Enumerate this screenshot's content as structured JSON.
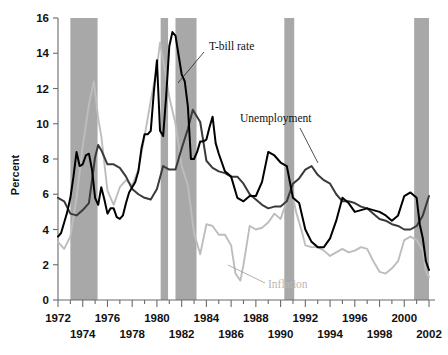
{
  "chart_data": {
    "type": "line",
    "title": "",
    "xlabel": "",
    "ylabel": "Percent",
    "xlim": [
      1972,
      2002
    ],
    "ylim": [
      0,
      16
    ],
    "ytick_step": 2,
    "grid": false,
    "legend_position": "inline-annotations",
    "ytick_labels": [
      "0",
      "2",
      "4",
      "6",
      "8",
      "10",
      "12",
      "14",
      "16"
    ],
    "xtick_labels_row1": [
      "1972",
      "1976",
      "1980",
      "1984",
      "1988",
      "1992",
      "1996",
      "2000"
    ],
    "xtick_labels_row2": [
      "1974",
      "1978",
      "1982",
      "1986",
      "1990",
      "1994",
      "1998",
      "2002"
    ],
    "xtick_years_row1": [
      1972,
      1976,
      1980,
      1984,
      1988,
      1992,
      1996,
      2000
    ],
    "xtick_years_row2": [
      1974,
      1978,
      1982,
      1986,
      1990,
      1994,
      1998,
      2002
    ],
    "annotations": [
      {
        "name": "t-bill-rate",
        "text": "T-bill rate",
        "color": "#111111"
      },
      {
        "name": "unemployment",
        "text": "Unemployment",
        "color": "#111111"
      },
      {
        "name": "inflation",
        "text": "Inflation",
        "color": "#b9b9b9"
      }
    ],
    "shaded_regions_label": "Recessions",
    "shaded_regions": [
      {
        "start": 1973.0,
        "end": 1975.2
      },
      {
        "start": 1980.3,
        "end": 1980.9
      },
      {
        "start": 1981.5,
        "end": 1983.2
      },
      {
        "start": 1990.3,
        "end": 1991.1
      },
      {
        "start": 2000.8,
        "end": 2002.6
      }
    ],
    "series": [
      {
        "name": "T-bill rate",
        "color": "#000000",
        "x": [
          1972.0,
          1972.25,
          1972.5,
          1972.75,
          1973.0,
          1973.25,
          1973.5,
          1973.75,
          1974.0,
          1974.25,
          1974.5,
          1974.75,
          1975.0,
          1975.25,
          1975.5,
          1975.75,
          1976.0,
          1976.25,
          1976.5,
          1976.75,
          1977.0,
          1977.25,
          1977.5,
          1977.75,
          1978.0,
          1978.25,
          1978.5,
          1978.75,
          1979.0,
          1979.25,
          1979.5,
          1979.75,
          1980.0,
          1980.25,
          1980.5,
          1980.75,
          1981.0,
          1981.25,
          1981.5,
          1981.75,
          1982.0,
          1982.25,
          1982.5,
          1982.75,
          1983.0,
          1983.25,
          1983.5,
          1983.75,
          1984.0,
          1984.25,
          1984.5,
          1984.75,
          1985.0,
          1985.5,
          1986.0,
          1986.5,
          1987.0,
          1987.5,
          1988.0,
          1988.5,
          1989.0,
          1989.5,
          1990.0,
          1990.5,
          1991.0,
          1991.5,
          1992.0,
          1992.5,
          1993.0,
          1993.5,
          1994.0,
          1994.5,
          1995.0,
          1995.5,
          1996.0,
          1996.5,
          1997.0,
          1997.5,
          1998.0,
          1998.5,
          1999.0,
          1999.5,
          2000.0,
          2000.5,
          2001.0,
          2001.25,
          2001.5,
          2001.75,
          2002.0
        ],
        "y": [
          3.6,
          3.8,
          4.4,
          5.0,
          5.8,
          7.0,
          8.4,
          7.6,
          7.7,
          8.2,
          8.3,
          7.4,
          5.8,
          5.4,
          6.4,
          5.7,
          4.9,
          5.2,
          5.2,
          4.7,
          4.6,
          4.8,
          5.5,
          6.1,
          6.4,
          6.7,
          7.3,
          8.6,
          9.4,
          9.4,
          9.6,
          11.8,
          13.6,
          9.6,
          9.3,
          11.6,
          14.4,
          15.2,
          15.0,
          13.9,
          12.8,
          12.4,
          11.0,
          8.0,
          8.0,
          8.4,
          9.0,
          9.0,
          9.1,
          9.8,
          10.4,
          8.9,
          8.3,
          7.3,
          7.0,
          5.8,
          5.6,
          5.9,
          5.9,
          6.7,
          8.4,
          8.2,
          7.8,
          7.6,
          5.8,
          5.5,
          4.0,
          3.3,
          3.0,
          3.0,
          3.5,
          4.5,
          5.8,
          5.5,
          5.0,
          5.1,
          5.2,
          5.1,
          5.0,
          4.8,
          4.5,
          4.8,
          5.9,
          6.1,
          5.8,
          4.3,
          3.5,
          2.2,
          1.7
        ]
      },
      {
        "name": "Unemployment",
        "color": "#3a3a3a",
        "x": [
          1972.0,
          1972.5,
          1973.0,
          1973.5,
          1974.0,
          1974.5,
          1975.0,
          1975.25,
          1975.5,
          1976.0,
          1976.5,
          1977.0,
          1977.5,
          1978.0,
          1978.5,
          1979.0,
          1979.5,
          1980.0,
          1980.5,
          1981.0,
          1981.5,
          1982.0,
          1982.5,
          1982.9,
          1983.5,
          1984.0,
          1984.5,
          1985.0,
          1985.5,
          1986.0,
          1986.5,
          1987.0,
          1987.5,
          1988.0,
          1988.5,
          1989.0,
          1989.5,
          1990.0,
          1990.5,
          1991.0,
          1991.5,
          1992.0,
          1992.5,
          1993.0,
          1993.5,
          1994.0,
          1994.5,
          1995.0,
          1995.5,
          1996.0,
          1996.5,
          1997.0,
          1997.5,
          1998.0,
          1998.5,
          1999.0,
          1999.5,
          2000.0,
          2000.5,
          2001.0,
          2001.5,
          2002.0
        ],
        "y": [
          5.8,
          5.6,
          4.9,
          4.8,
          5.1,
          5.5,
          8.1,
          8.8,
          8.5,
          7.7,
          7.7,
          7.5,
          7.0,
          6.3,
          6.0,
          5.8,
          5.7,
          6.3,
          7.6,
          7.4,
          7.4,
          8.6,
          9.7,
          10.8,
          10.1,
          7.9,
          7.5,
          7.3,
          7.2,
          7.0,
          7.0,
          6.6,
          6.0,
          5.7,
          5.4,
          5.2,
          5.3,
          5.3,
          5.6,
          6.6,
          6.9,
          7.4,
          7.6,
          7.1,
          6.8,
          6.6,
          6.0,
          5.6,
          5.6,
          5.5,
          5.3,
          5.2,
          4.9,
          4.6,
          4.5,
          4.3,
          4.2,
          4.0,
          4.0,
          4.2,
          4.8,
          5.9
        ]
      },
      {
        "name": "Inflation",
        "color": "#bdbdbd",
        "x": [
          1972.0,
          1972.5,
          1973.0,
          1973.5,
          1974.0,
          1974.5,
          1974.9,
          1975.25,
          1975.5,
          1976.0,
          1976.5,
          1977.0,
          1977.5,
          1978.0,
          1978.5,
          1979.0,
          1979.5,
          1980.0,
          1980.25,
          1980.75,
          1981.0,
          1981.5,
          1982.0,
          1982.5,
          1983.0,
          1983.5,
          1984.0,
          1984.5,
          1985.0,
          1985.5,
          1986.0,
          1986.35,
          1986.75,
          1987.0,
          1987.5,
          1988.0,
          1988.5,
          1989.0,
          1989.5,
          1990.0,
          1990.5,
          1990.9,
          1991.25,
          1991.75,
          1992.0,
          1992.5,
          1993.0,
          1993.5,
          1994.0,
          1994.5,
          1995.0,
          1995.5,
          1996.0,
          1996.5,
          1997.0,
          1997.5,
          1998.0,
          1998.5,
          1999.0,
          1999.5,
          2000.0,
          2000.5,
          2001.0,
          2001.5,
          2001.75,
          2002.0
        ],
        "y": [
          3.3,
          2.9,
          3.6,
          5.8,
          8.7,
          11.1,
          12.4,
          10.3,
          9.3,
          6.2,
          5.4,
          6.4,
          6.8,
          6.5,
          7.4,
          9.3,
          11.3,
          13.2,
          14.6,
          12.6,
          11.5,
          10.0,
          7.6,
          6.5,
          3.8,
          2.6,
          4.3,
          4.2,
          3.7,
          3.7,
          3.1,
          1.5,
          1.1,
          2.0,
          4.2,
          4.0,
          4.1,
          4.4,
          4.9,
          4.6,
          5.6,
          6.2,
          5.0,
          3.8,
          3.1,
          3.0,
          3.0,
          2.8,
          2.5,
          2.7,
          2.9,
          2.7,
          2.8,
          3.0,
          2.9,
          2.2,
          1.6,
          1.5,
          1.8,
          2.2,
          3.4,
          3.6,
          3.4,
          2.8,
          1.6,
          1.3
        ]
      }
    ]
  },
  "axis": {
    "ylabel": "Percent"
  }
}
